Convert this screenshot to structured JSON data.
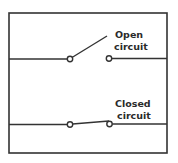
{
  "diagram": {
    "type": "circuit-switch-comparison",
    "stroke_color": "#333333",
    "background_color": "#ffffff",
    "frame": {
      "x": 9,
      "y": 13,
      "width": 158,
      "height": 140
    },
    "switches": [
      {
        "id": "open",
        "state": "open",
        "label_line1": "Open",
        "label_line2": "circuit",
        "wire_y": 59
      },
      {
        "id": "closed",
        "state": "closed",
        "label_line1": "Closed",
        "label_line2": "circuit",
        "wire_y": 124
      }
    ]
  }
}
